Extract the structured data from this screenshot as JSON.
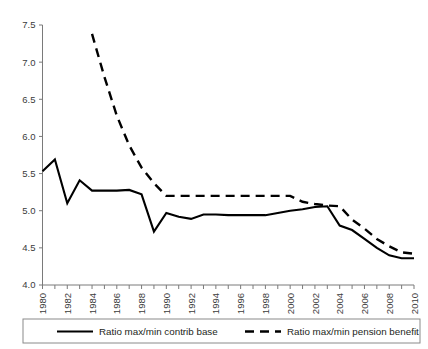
{
  "chart_data": {
    "type": "line",
    "title": "",
    "subtitle": "",
    "xlabel": "",
    "ylabel": "",
    "xlim": [
      1980,
      2010
    ],
    "ylim": [
      4.0,
      7.5
    ],
    "grid": false,
    "legend_position": "bottom",
    "y_ticks": [
      "4.0",
      "4.5",
      "5.0",
      "5.5",
      "6.0",
      "6.5",
      "7.0",
      "7.5"
    ],
    "y_tick_values": [
      4.0,
      4.5,
      5.0,
      5.5,
      6.0,
      6.5,
      7.0,
      7.5
    ],
    "x_ticks": [
      "1980",
      "1982",
      "1984",
      "1986",
      "1988",
      "1990",
      "1992",
      "1994",
      "1996",
      "1998",
      "2000",
      "2002",
      "2004",
      "2006",
      "2008",
      "2010"
    ],
    "x_tick_values": [
      1980,
      1982,
      1984,
      1986,
      1988,
      1990,
      1992,
      1994,
      1996,
      1998,
      2000,
      2002,
      2004,
      2006,
      2008,
      2010
    ],
    "x_minor_step": 1,
    "series": [
      {
        "name": "Ratio max/min contrib base",
        "style": "solid",
        "color": "#000000",
        "x": [
          1980,
          1981,
          1982,
          1983,
          1984,
          1985,
          1986,
          1987,
          1988,
          1989,
          1990,
          1991,
          1992,
          1993,
          1994,
          1995,
          1996,
          1997,
          1998,
          1999,
          2000,
          2001,
          2002,
          2003,
          2004,
          2005,
          2006,
          2007,
          2008,
          2009,
          2010
        ],
        "values": [
          5.53,
          5.69,
          5.1,
          5.41,
          5.27,
          5.27,
          5.27,
          5.28,
          5.22,
          4.72,
          4.97,
          4.92,
          4.89,
          4.95,
          4.95,
          4.94,
          4.94,
          4.94,
          4.94,
          4.97,
          5.0,
          5.02,
          5.05,
          5.06,
          4.8,
          4.74,
          4.62,
          4.5,
          4.4,
          4.36,
          4.36
        ]
      },
      {
        "name": "Ratio max/min pension  benefit",
        "style": "dashed",
        "color": "#000000",
        "x": [
          1984,
          1985,
          1986,
          1987,
          1988,
          1989,
          1990,
          1991,
          1992,
          1993,
          1994,
          1995,
          1996,
          1997,
          1998,
          1999,
          2000,
          2001,
          2002,
          2003,
          2004,
          2005,
          2006,
          2007,
          2008,
          2009,
          2010
        ],
        "values": [
          7.38,
          6.8,
          6.28,
          5.88,
          5.58,
          5.37,
          5.2,
          5.2,
          5.2,
          5.2,
          5.2,
          5.2,
          5.2,
          5.2,
          5.2,
          5.2,
          5.2,
          5.12,
          5.09,
          5.07,
          5.06,
          4.88,
          4.76,
          4.62,
          4.52,
          4.44,
          4.42
        ]
      }
    ]
  },
  "legend": {
    "items": [
      {
        "label": "Ratio max/min contrib base",
        "style": "solid"
      },
      {
        "label": "Ratio max/min pension  benefit",
        "style": "dashed"
      }
    ]
  }
}
